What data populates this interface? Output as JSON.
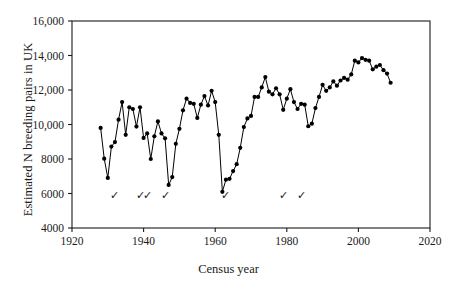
{
  "chart_data": {
    "type": "line",
    "title": "",
    "xlabel": "Census year",
    "ylabel": "Estimated N breeding pairs in UK",
    "xlim": [
      1920,
      2020
    ],
    "ylim": [
      4000,
      16000
    ],
    "xticks": [
      1920,
      1940,
      1960,
      1980,
      2000,
      2020
    ],
    "xtick_labels": [
      "1920",
      "1940",
      "1960",
      "1980",
      "2000",
      "2020"
    ],
    "yticks": [
      4000,
      6000,
      8000,
      10000,
      12000,
      14000,
      16000
    ],
    "ytick_labels": [
      "4000",
      "6000",
      "8000",
      "10,000",
      "12,000",
      "14,000",
      "16,000"
    ],
    "grid": false,
    "legend": null,
    "marker": "filled-circle",
    "marker_color": "#000000",
    "line_color": "#000000",
    "x": [
      1928,
      1929,
      1930,
      1931,
      1932,
      1933,
      1934,
      1935,
      1936,
      1937,
      1938,
      1939,
      1940,
      1941,
      1942,
      1943,
      1944,
      1945,
      1946,
      1947,
      1948,
      1949,
      1950,
      1951,
      1952,
      1953,
      1954,
      1955,
      1956,
      1957,
      1958,
      1959,
      1960,
      1961,
      1962,
      1963,
      1964,
      1965,
      1966,
      1967,
      1968,
      1969,
      1970,
      1971,
      1972,
      1973,
      1974,
      1975,
      1976,
      1977,
      1978,
      1979,
      1980,
      1981,
      1982,
      1983,
      1984,
      1985,
      1986,
      1987,
      1988,
      1989,
      1990,
      1991,
      1992,
      1993,
      1994,
      1995,
      1996,
      1997,
      1998,
      1999,
      2000,
      2001,
      2002,
      2003,
      2004,
      2005,
      2006,
      2007,
      2008,
      2009
    ],
    "values": [
      9800,
      8020,
      6900,
      8720,
      8980,
      10280,
      11300,
      9400,
      11000,
      10900,
      9880,
      11000,
      9220,
      9480,
      8000,
      9320,
      10180,
      9480,
      9200,
      6500,
      6950,
      8880,
      9750,
      10820,
      11500,
      11250,
      11200,
      10380,
      11150,
      11650,
      11100,
      11950,
      11300,
      9400,
      6100,
      6800,
      6850,
      7300,
      7700,
      8650,
      9850,
      10350,
      10500,
      11600,
      11600,
      12150,
      12750,
      11900,
      11750,
      12100,
      11750,
      10850,
      11500,
      12050,
      11300,
      10900,
      11200,
      11150,
      9900,
      10050,
      10950,
      11600,
      12300,
      11950,
      12150,
      12500,
      12250,
      12550,
      12700,
      12600,
      12900,
      13700,
      13600,
      13850,
      13750,
      13700,
      13200,
      13350,
      13450,
      13150,
      12950,
      12420
    ],
    "annotations": {
      "symbol": "✓",
      "y_value": 5700,
      "years": [
        1932,
        1939,
        1941,
        1946,
        1963,
        1979,
        1984
      ]
    }
  },
  "axes": {
    "xlabel": "Census year",
    "ylabel": "Estimated N breeding pairs in UK"
  }
}
